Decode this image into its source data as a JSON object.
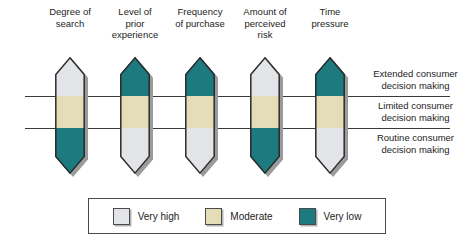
{
  "figure": {
    "type": "diagram",
    "subtype": "consumer-decision-making-continuum",
    "colors": {
      "very_high": "#e3e4e8",
      "moderate": "#e5dcb8",
      "very_low": "#1d7a7e",
      "outline": "#2b2b2b",
      "shadow": "#9b9b9b",
      "rule": "#3a3a3a",
      "text": "#1d1d1d"
    }
  },
  "columns": [
    {
      "id": "degree-of-search",
      "label": "Degree of\nsearch",
      "segments": [
        "very_high",
        "moderate",
        "very_low"
      ]
    },
    {
      "id": "level-of-prior-experience",
      "label": "Level of\nprior\nexperience",
      "segments": [
        "very_low",
        "moderate",
        "very_high"
      ]
    },
    {
      "id": "frequency-of-purchase",
      "label": "Frequency\nof purchase",
      "segments": [
        "very_low",
        "moderate",
        "very_high"
      ]
    },
    {
      "id": "amount-of-perceived-risk",
      "label": "Amount of\nperceived\nrisk",
      "segments": [
        "very_high",
        "moderate",
        "very_low"
      ]
    },
    {
      "id": "time-pressure",
      "label": "Time\npressure",
      "segments": [
        "very_low",
        "moderate",
        "very_high"
      ]
    }
  ],
  "stages": [
    {
      "id": "extended",
      "label": "Extended consumer\ndecision making"
    },
    {
      "id": "limited",
      "label": "Limited consumer\ndecision making"
    },
    {
      "id": "routine",
      "label": "Routine consumer\ndecision making"
    }
  ],
  "legend": {
    "items": [
      {
        "id": "very-high",
        "label": "Very high",
        "color": "#e3e4e8"
      },
      {
        "id": "moderate",
        "label": "Moderate",
        "color": "#e5dcb8"
      },
      {
        "id": "very-low",
        "label": "Very low",
        "color": "#1d7a7e"
      }
    ]
  }
}
